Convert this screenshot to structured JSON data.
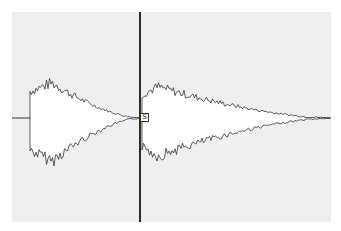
{
  "view": {
    "type": "audio-waveform-editor",
    "background": "#efefef",
    "waveform_fill": "#ffffff",
    "waveform_stroke": "#333333",
    "baseline_y": 118
  },
  "cursor": {
    "x": 140
  },
  "marker": {
    "label": "S"
  },
  "segments": [
    {
      "name": "segment-1",
      "start_x": 30,
      "end_x": 140,
      "peak_x": 52,
      "peak_amp": 43
    },
    {
      "name": "segment-2",
      "start_x": 142,
      "end_x": 330,
      "peak_x": 158,
      "peak_amp": 38
    }
  ]
}
